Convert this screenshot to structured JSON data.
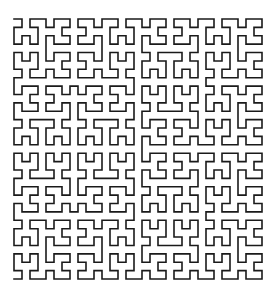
{
  "figure": {
    "type": "hilbert-curve",
    "order": 5,
    "grid_size": 32,
    "orientation": "start top-left, end bottom-left",
    "bounds": {
      "x0": 14,
      "y0": 19,
      "x1": 262,
      "y1": 279
    },
    "stroke_color": "#1a1a1a",
    "stroke_width": 1.6,
    "background": "#ffffff"
  }
}
